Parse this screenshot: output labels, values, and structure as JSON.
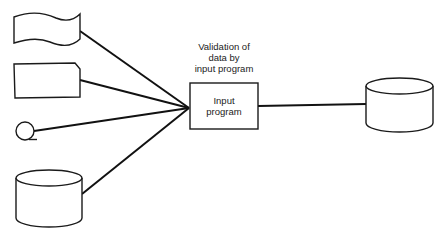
{
  "diagram": {
    "type": "system flowchart",
    "annotation": {
      "lines": [
        "Validation of",
        "data by",
        "input program"
      ]
    },
    "process": {
      "shape": "rectangle",
      "label_lines": [
        "Input",
        "program"
      ]
    },
    "inputs": [
      {
        "id": "paper-tape",
        "shape": "paper tape (wavy)",
        "label": ""
      },
      {
        "id": "punched-card",
        "shape": "punched card (notched corner)",
        "label": ""
      },
      {
        "id": "magnetic-tape",
        "shape": "magnetic tape reel (circle)",
        "label": ""
      },
      {
        "id": "magnetic-disk-input",
        "shape": "magnetic disk (cylinder)",
        "label": ""
      }
    ],
    "outputs": [
      {
        "id": "magnetic-disk-output",
        "shape": "magnetic disk (cylinder)",
        "label": ""
      }
    ],
    "edges": [
      {
        "from": "paper-tape",
        "to": "input-program"
      },
      {
        "from": "punched-card",
        "to": "input-program"
      },
      {
        "from": "magnetic-tape",
        "to": "input-program"
      },
      {
        "from": "magnetic-disk-input",
        "to": "input-program"
      },
      {
        "from": "input-program",
        "to": "magnetic-disk-output"
      }
    ],
    "colors": {
      "stroke": "#1a1a1a",
      "background": "#ffffff",
      "text": "#222222"
    }
  }
}
